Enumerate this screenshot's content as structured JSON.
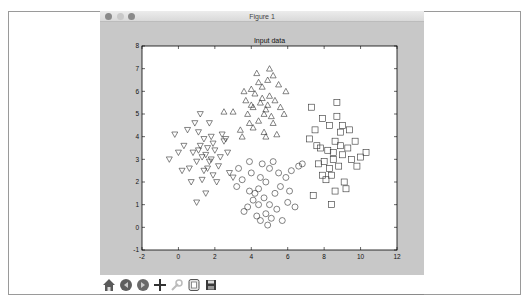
{
  "window": {
    "title": "Figure 1",
    "toolbar": [
      {
        "name": "home-icon",
        "label": "Home"
      },
      {
        "name": "back-icon",
        "label": "Back"
      },
      {
        "name": "forward-icon",
        "label": "Forward"
      },
      {
        "name": "pan-icon",
        "label": "Pan"
      },
      {
        "name": "zoom-rect-icon",
        "label": "Zoom"
      },
      {
        "name": "subplots-icon",
        "label": "Configure subplots"
      },
      {
        "name": "save-icon",
        "label": "Save"
      }
    ]
  },
  "chart_data": {
    "type": "scatter",
    "title": "Input data",
    "xlabel": "",
    "ylabel": "",
    "xlim": [
      -2,
      12
    ],
    "ylim": [
      -1,
      8
    ],
    "xticks": [
      "-2",
      "0",
      "2",
      "4",
      "6",
      "8",
      "10",
      "12"
    ],
    "yticks": [
      "-1",
      "0",
      "1",
      "2",
      "3",
      "4",
      "5",
      "6",
      "7",
      "8"
    ],
    "grid": false,
    "series": [
      {
        "name": "class-0",
        "marker": "triangle-down",
        "points": [
          [
            1.5,
            3.2
          ],
          [
            1.2,
            3.6
          ],
          [
            1.8,
            3.0
          ],
          [
            2.0,
            3.4
          ],
          [
            1.0,
            2.9
          ],
          [
            1.6,
            2.6
          ],
          [
            2.3,
            3.1
          ],
          [
            0.8,
            3.3
          ],
          [
            1.4,
            3.9
          ],
          [
            2.5,
            3.8
          ],
          [
            1.1,
            4.2
          ],
          [
            0.5,
            4.3
          ],
          [
            -0.2,
            4.1
          ],
          [
            0.3,
            3.6
          ],
          [
            0.0,
            3.3
          ],
          [
            -0.5,
            3.0
          ],
          [
            1.9,
            2.3
          ],
          [
            1.3,
            2.1
          ],
          [
            0.7,
            2.0
          ],
          [
            2.2,
            2.7
          ],
          [
            2.7,
            3.3
          ],
          [
            1.7,
            4.6
          ],
          [
            1.2,
            5.0
          ],
          [
            0.9,
            4.6
          ],
          [
            2.4,
            4.1
          ],
          [
            1.5,
            1.5
          ],
          [
            1.0,
            1.1
          ],
          [
            2.8,
            2.4
          ],
          [
            1.6,
            3.5
          ],
          [
            1.9,
            3.7
          ],
          [
            0.6,
            2.6
          ],
          [
            2.1,
            2.0
          ],
          [
            1.3,
            3.1
          ],
          [
            1.7,
            2.9
          ],
          [
            1.1,
            3.4
          ],
          [
            2.6,
            3.9
          ],
          [
            0.2,
            2.5
          ],
          [
            3.0,
            2.2
          ],
          [
            1.4,
            2.5
          ],
          [
            1.8,
            4.0
          ]
        ]
      },
      {
        "name": "class-1",
        "marker": "triangle-up",
        "points": [
          [
            4.5,
            5.5
          ],
          [
            4.2,
            5.9
          ],
          [
            4.8,
            5.2
          ],
          [
            5.0,
            5.8
          ],
          [
            4.0,
            5.4
          ],
          [
            4.6,
            6.2
          ],
          [
            5.3,
            5.6
          ],
          [
            3.8,
            5.0
          ],
          [
            4.4,
            4.7
          ],
          [
            5.2,
            4.6
          ],
          [
            4.9,
            6.5
          ],
          [
            4.3,
            6.8
          ],
          [
            5.5,
            6.3
          ],
          [
            5.9,
            6.0
          ],
          [
            5.6,
            5.3
          ],
          [
            3.6,
            6.0
          ],
          [
            2.5,
            5.1
          ],
          [
            3.0,
            5.1
          ],
          [
            4.1,
            4.4
          ],
          [
            4.7,
            4.2
          ],
          [
            5.1,
            4.9
          ],
          [
            3.9,
            4.6
          ],
          [
            5.8,
            5.0
          ],
          [
            5.0,
            7.0
          ],
          [
            4.6,
            5.7
          ],
          [
            4.1,
            5.3
          ],
          [
            3.4,
            4.3
          ],
          [
            4.8,
            4.0
          ],
          [
            5.4,
            4.1
          ],
          [
            3.7,
            5.6
          ],
          [
            4.4,
            6.4
          ],
          [
            5.2,
            6.7
          ],
          [
            4.0,
            6.1
          ],
          [
            4.9,
            5.4
          ],
          [
            3.5,
            4.0
          ],
          [
            4.7,
            5.0
          ]
        ]
      },
      {
        "name": "class-2",
        "marker": "circle",
        "points": [
          [
            4.7,
            1.3
          ],
          [
            4.4,
            1.7
          ],
          [
            5.0,
            1.0
          ],
          [
            5.3,
            1.5
          ],
          [
            4.1,
            1.2
          ],
          [
            4.8,
            2.0
          ],
          [
            5.6,
            1.8
          ],
          [
            3.8,
            0.9
          ],
          [
            4.3,
            0.5
          ],
          [
            5.1,
            0.4
          ],
          [
            4.9,
            0.1
          ],
          [
            4.5,
            0.3
          ],
          [
            5.9,
            2.2
          ],
          [
            6.2,
            2.5
          ],
          [
            6.6,
            2.7
          ],
          [
            5.5,
            2.4
          ],
          [
            4.0,
            2.4
          ],
          [
            3.5,
            2.1
          ],
          [
            3.2,
            1.8
          ],
          [
            3.9,
            2.9
          ],
          [
            4.6,
            2.8
          ],
          [
            5.2,
            2.9
          ],
          [
            6.0,
            1.1
          ],
          [
            6.4,
            0.9
          ],
          [
            3.6,
            0.7
          ],
          [
            4.2,
            1.5
          ],
          [
            5.4,
            0.8
          ],
          [
            4.8,
            0.6
          ],
          [
            3.3,
            2.6
          ],
          [
            5.7,
            0.3
          ],
          [
            6.1,
            1.6
          ],
          [
            4.5,
            2.2
          ],
          [
            5.0,
            2.6
          ],
          [
            3.9,
            1.6
          ],
          [
            4.4,
            1.0
          ],
          [
            6.8,
            2.8
          ]
        ]
      },
      {
        "name": "class-3",
        "marker": "square",
        "points": [
          [
            8.5,
            3.0
          ],
          [
            8.2,
            3.4
          ],
          [
            8.8,
            2.7
          ],
          [
            9.0,
            3.2
          ],
          [
            8.0,
            2.9
          ],
          [
            8.6,
            3.8
          ],
          [
            9.3,
            3.5
          ],
          [
            7.8,
            3.5
          ],
          [
            8.4,
            2.3
          ],
          [
            9.1,
            2.0
          ],
          [
            8.9,
            4.2
          ],
          [
            8.3,
            4.5
          ],
          [
            9.4,
            4.3
          ],
          [
            9.7,
            3.8
          ],
          [
            8.7,
            4.9
          ],
          [
            7.9,
            4.8
          ],
          [
            7.5,
            4.3
          ],
          [
            7.6,
            3.6
          ],
          [
            7.7,
            2.8
          ],
          [
            8.1,
            2.1
          ],
          [
            8.6,
            1.6
          ],
          [
            8.4,
            1.0
          ],
          [
            9.2,
            1.7
          ],
          [
            7.4,
            1.4
          ],
          [
            10.0,
            3.1
          ],
          [
            10.3,
            3.3
          ],
          [
            9.8,
            2.7
          ],
          [
            8.7,
            5.5
          ],
          [
            7.3,
            5.3
          ],
          [
            7.2,
            3.9
          ],
          [
            8.5,
            3.3
          ],
          [
            8.3,
            2.6
          ],
          [
            9.5,
            3.0
          ],
          [
            7.9,
            2.3
          ],
          [
            8.9,
            3.6
          ],
          [
            9.0,
            4.5
          ]
        ]
      }
    ]
  }
}
